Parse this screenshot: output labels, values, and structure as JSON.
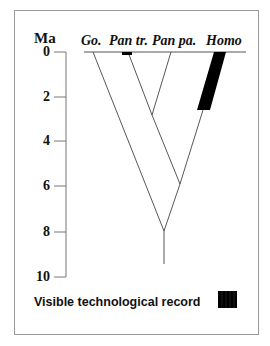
{
  "diagram": {
    "axis": {
      "title": "Ma",
      "ticks": [
        {
          "value": "0",
          "y": 52
        },
        {
          "value": "2",
          "y": 97
        },
        {
          "value": "4",
          "y": 141
        },
        {
          "value": "6",
          "y": 186
        },
        {
          "value": "8",
          "y": 232
        },
        {
          "value": "10",
          "y": 277
        }
      ]
    },
    "taxa": [
      {
        "label": "Go.",
        "x": 82
      },
      {
        "label": "Pan tr.",
        "x": 110
      },
      {
        "label": "Pan pa.",
        "x": 154
      },
      {
        "label": "Homo",
        "x": 208
      }
    ],
    "nodes": [
      {
        "name": "pan-split",
        "age_ma": 2.8
      },
      {
        "name": "pan-homo-split",
        "age_ma": 5.9
      },
      {
        "name": "gorilla-split",
        "age_ma": 8.0
      }
    ],
    "legend": {
      "label": "Visible technological record",
      "swatch_color": "#000000"
    },
    "colors": {
      "line": "#444444",
      "bar": "#000000",
      "frame": "#9a9a9a"
    }
  }
}
